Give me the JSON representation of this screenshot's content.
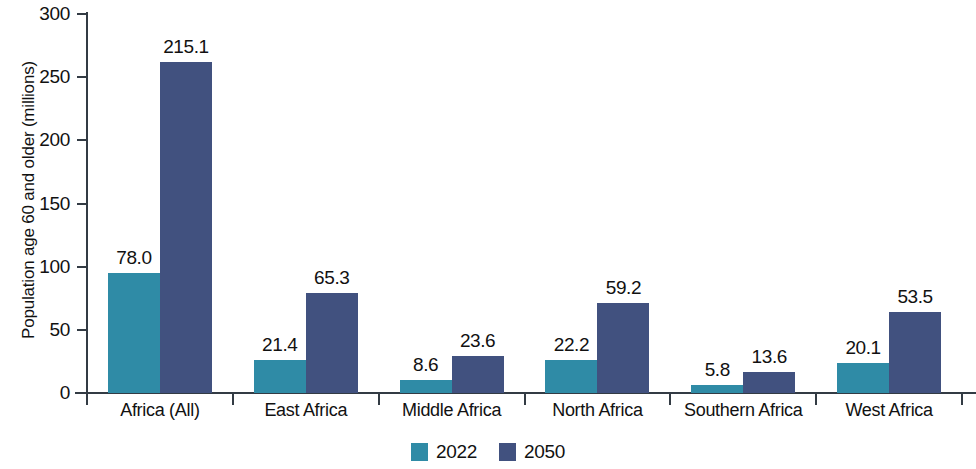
{
  "chart_data": {
    "type": "bar",
    "title": "",
    "xlabel": "",
    "ylabel": "Population age 60 and older (millions)",
    "ylim": [
      0,
      300
    ],
    "ytick_values": [
      0,
      50,
      100,
      150,
      200,
      250,
      300
    ],
    "ytick_labels": [
      "0",
      "50",
      "100",
      "150",
      "200",
      "250",
      "300"
    ],
    "grid": false,
    "legend_position": "bottom-center",
    "categories": [
      "Africa (All)",
      "East Africa",
      "Middle Africa",
      "North Africa",
      "Southern Africa",
      "West Africa"
    ],
    "series": [
      {
        "name": "2022",
        "color": "#2f8ba6",
        "values": [
          78.0,
          21.4,
          8.6,
          22.2,
          5.8,
          20.1
        ],
        "labels": [
          "78.0",
          "21.4",
          "8.6",
          "22.2",
          "5.8",
          "20.1"
        ],
        "drawn_heights": [
          95,
          26,
          10,
          26,
          6,
          24
        ]
      },
      {
        "name": "2050",
        "color": "#41517f",
        "values": [
          215.1,
          65.3,
          23.6,
          59.2,
          13.6,
          53.5
        ],
        "labels": [
          "215.1",
          "65.3",
          "23.6",
          "59.2",
          "13.6",
          "53.5"
        ],
        "drawn_heights": [
          262,
          79,
          29,
          71,
          17,
          64
        ]
      }
    ]
  },
  "legend": {
    "items": [
      {
        "label": "2022",
        "color": "#2f8ba6"
      },
      {
        "label": "2050",
        "color": "#41517f"
      }
    ]
  },
  "axis": {
    "y_title": "Population age 60 and older (millions)"
  }
}
